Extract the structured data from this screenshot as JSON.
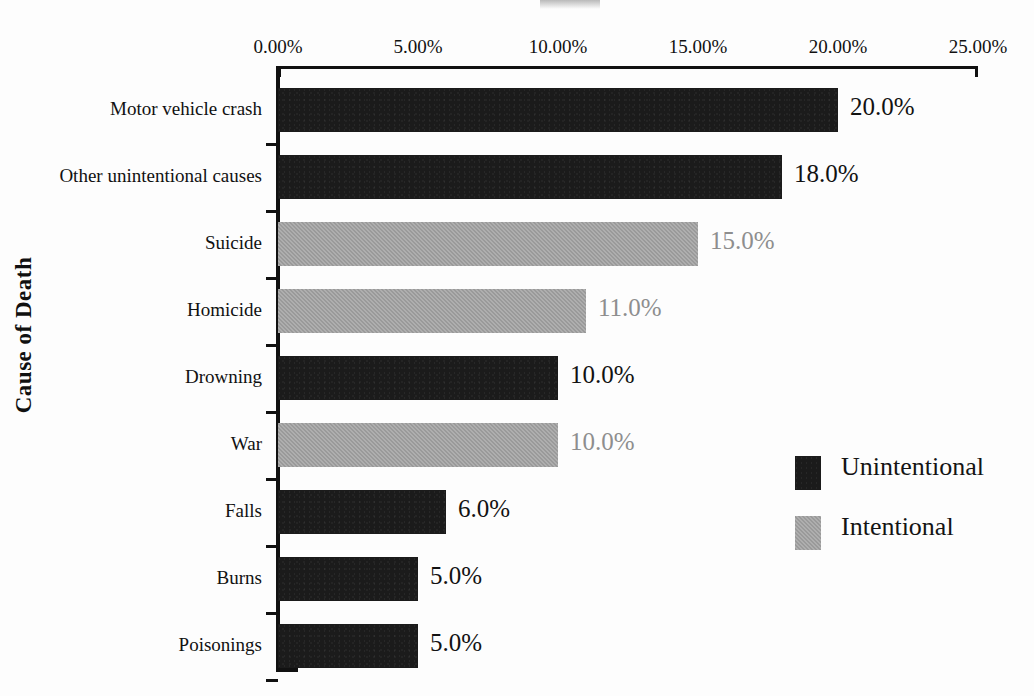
{
  "chart_data": {
    "type": "bar",
    "orientation": "horizontal",
    "title": "",
    "xlabel": "",
    "ylabel": "Cause of Death",
    "xlim": [
      0,
      25
    ],
    "grid": false,
    "legend_position": "right",
    "xtick_labels": [
      "0.00%",
      "5.00%",
      "10.00%",
      "15.00%",
      "20.00%",
      "25.00%"
    ],
    "xtick_values": [
      0,
      5,
      10,
      15,
      20,
      25
    ],
    "categories": [
      "Motor vehicle crash",
      "Other unintentional causes",
      "Suicide",
      "Homicide",
      "Drowning",
      "War",
      "Falls",
      "Burns",
      "Poisonings"
    ],
    "values": [
      20.0,
      18.0,
      15.0,
      11.0,
      10.0,
      10.0,
      6.0,
      5.0,
      5.0
    ],
    "value_labels": [
      "20.0%",
      "18.0%",
      "15.0%",
      "11.0%",
      "10.0%",
      "10.0%",
      "6.0%",
      "5.0%",
      "5.0%"
    ],
    "series_of_bar": [
      "Unintentional",
      "Unintentional",
      "Intentional",
      "Intentional",
      "Unintentional",
      "Intentional",
      "Unintentional",
      "Unintentional",
      "Unintentional"
    ],
    "series": [
      {
        "name": "Unintentional",
        "color": "#1b1b1b"
      },
      {
        "name": "Intentional",
        "color": "#9a9a9a"
      }
    ],
    "legend": [
      {
        "label": "Unintentional",
        "color": "#1b1b1b"
      },
      {
        "label": "Intentional",
        "color": "#9a9a9a"
      }
    ]
  }
}
